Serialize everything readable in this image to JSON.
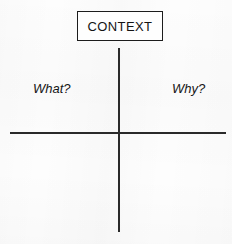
{
  "diagram": {
    "type": "quadrant-matrix",
    "header": {
      "label": "CONTEXT"
    },
    "quadrant_labels": [
      {
        "position": "top-left",
        "text": "What?"
      },
      {
        "position": "top-right",
        "text": "Why?"
      }
    ],
    "axes": {
      "vertical": {
        "name": "vertical-divider"
      },
      "horizontal": {
        "name": "horizontal-divider"
      }
    },
    "colors": {
      "line": "#2a2a2a",
      "box_border": "#1c1c1c",
      "text": "#141414",
      "background": "#fdfdfd"
    }
  }
}
